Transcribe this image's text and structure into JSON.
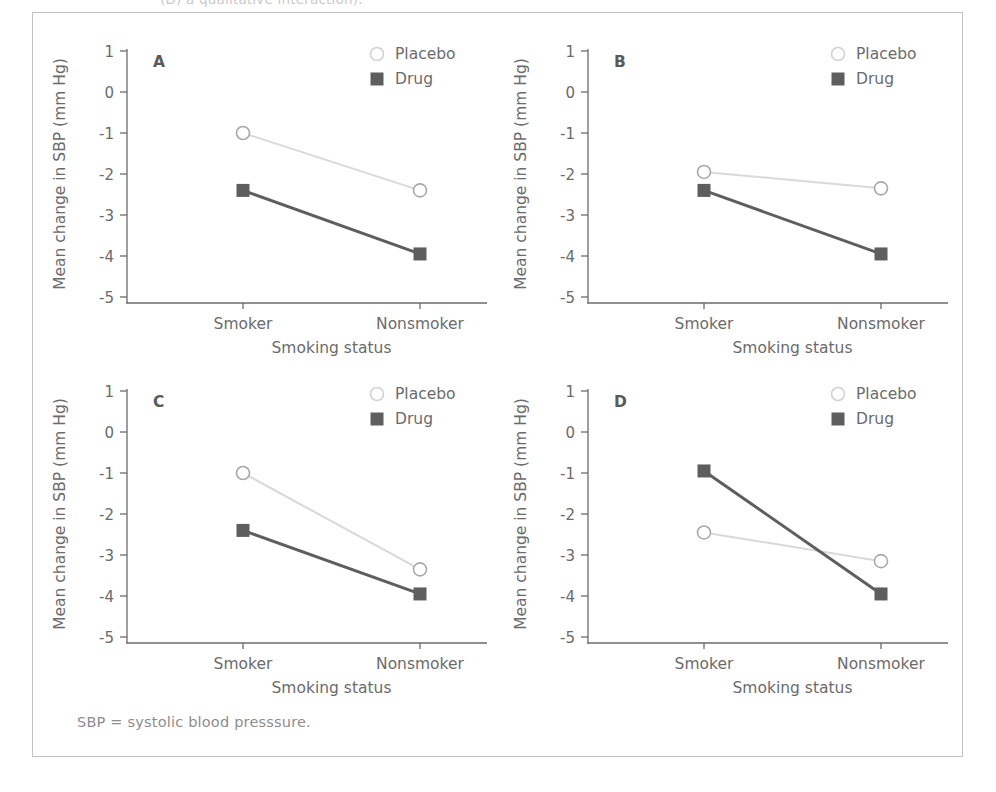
{
  "figure": {
    "top_clipped_text": "(D) a qualitative interaction).",
    "note": "SBP = systolic blood presssure.",
    "frame_color": "#c2c2c2",
    "background": "#ffffff"
  },
  "style": {
    "placebo_color": "#d9d9d9",
    "drug_color": "#5e5e5e",
    "axis_color": "#6b6b6b",
    "text_color": "#6b6b6b"
  },
  "legend": {
    "placebo_label": "Placebo",
    "drug_label": "Drug",
    "placebo_marker": "open-circle",
    "drug_marker": "filled-square"
  },
  "axes": {
    "ylabel": "Mean change in SBP (mm Hg)",
    "xlabel": "Smoking status",
    "yticks": [
      "1",
      "0",
      "-1",
      "-2",
      "-3",
      "-4",
      "-5"
    ],
    "ytick_values": [
      1,
      0,
      -1,
      -2,
      -3,
      -4,
      -5
    ],
    "ylim": [
      -5,
      1
    ],
    "categories": [
      "Smoker",
      "Nonsmoker"
    ]
  },
  "chart_data": [
    {
      "id": "A",
      "type": "line",
      "title": "A",
      "xlabel": "Smoking status",
      "ylabel": "Mean change in SBP (mm Hg)",
      "categories": [
        "Smoker",
        "Nonsmoker"
      ],
      "ylim": [
        -5,
        1
      ],
      "yticks": [
        1,
        0,
        -1,
        -2,
        -3,
        -4,
        -5
      ],
      "grid": false,
      "legend_position": "top-right",
      "series": [
        {
          "name": "Placebo",
          "values": [
            -1.0,
            -2.4
          ],
          "marker": "open-circle",
          "color": "#d9d9d9"
        },
        {
          "name": "Drug",
          "values": [
            -2.4,
            -3.95
          ],
          "marker": "filled-square",
          "color": "#5e5e5e"
        }
      ]
    },
    {
      "id": "B",
      "type": "line",
      "title": "B",
      "xlabel": "Smoking status",
      "ylabel": "Mean change in SBP (mm Hg)",
      "categories": [
        "Smoker",
        "Nonsmoker"
      ],
      "ylim": [
        -5,
        1
      ],
      "yticks": [
        1,
        0,
        -1,
        -2,
        -3,
        -4,
        -5
      ],
      "grid": false,
      "legend_position": "top-right",
      "series": [
        {
          "name": "Placebo",
          "values": [
            -1.95,
            -2.35
          ],
          "marker": "open-circle",
          "color": "#d9d9d9"
        },
        {
          "name": "Drug",
          "values": [
            -2.4,
            -3.95
          ],
          "marker": "filled-square",
          "color": "#5e5e5e"
        }
      ]
    },
    {
      "id": "C",
      "type": "line",
      "title": "C",
      "xlabel": "Smoking status",
      "ylabel": "Mean change in SBP (mm Hg)",
      "categories": [
        "Smoker",
        "Nonsmoker"
      ],
      "ylim": [
        -5,
        1
      ],
      "yticks": [
        1,
        0,
        -1,
        -2,
        -3,
        -4,
        -5
      ],
      "grid": false,
      "legend_position": "top-right",
      "series": [
        {
          "name": "Placebo",
          "values": [
            -1.0,
            -3.35
          ],
          "marker": "open-circle",
          "color": "#d9d9d9"
        },
        {
          "name": "Drug",
          "values": [
            -2.4,
            -3.95
          ],
          "marker": "filled-square",
          "color": "#5e5e5e"
        }
      ]
    },
    {
      "id": "D",
      "type": "line",
      "title": "D",
      "xlabel": "Smoking status",
      "ylabel": "Mean change in SBP (mm Hg)",
      "categories": [
        "Smoker",
        "Nonsmoker"
      ],
      "ylim": [
        -5,
        1
      ],
      "yticks": [
        1,
        0,
        -1,
        -2,
        -3,
        -4,
        -5
      ],
      "grid": false,
      "legend_position": "top-right",
      "series": [
        {
          "name": "Placebo",
          "values": [
            -2.45,
            -3.15
          ],
          "marker": "open-circle",
          "color": "#d9d9d9"
        },
        {
          "name": "Drug",
          "values": [
            -0.95,
            -3.95
          ],
          "marker": "filled-square",
          "color": "#5e5e5e"
        }
      ]
    }
  ]
}
